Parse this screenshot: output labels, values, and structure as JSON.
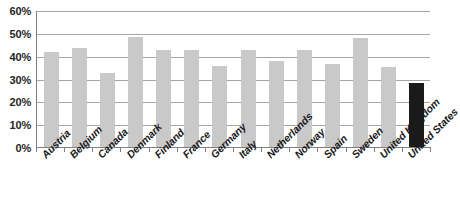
{
  "chart_data": {
    "type": "bar",
    "title": "",
    "subtitle": "",
    "xlabel": "",
    "ylabel": "",
    "ylim": [
      0,
      60
    ],
    "y_unit": "%",
    "grid": true,
    "legend": "none",
    "y_ticks": [
      "0%",
      "10%",
      "20%",
      "30%",
      "40%",
      "50%",
      "60%"
    ],
    "y_tick_values": [
      0,
      10,
      20,
      30,
      40,
      50,
      60
    ],
    "categories": [
      "Austria",
      "Belgium",
      "Canada",
      "Denmark",
      "Finland",
      "France",
      "Germany",
      "Italy",
      "Netherlands",
      "Norway",
      "Spain",
      "Sweden",
      "United Kingdom",
      "United States"
    ],
    "values": [
      42,
      44,
      33,
      48.5,
      43,
      43,
      36,
      43,
      38,
      43,
      37,
      48,
      35.5,
      28.5
    ],
    "bar_colors": [
      "#c9c9c9",
      "#c9c9c9",
      "#c9c9c9",
      "#c9c9c9",
      "#c9c9c9",
      "#c9c9c9",
      "#c9c9c9",
      "#c9c9c9",
      "#c9c9c9",
      "#c9c9c9",
      "#c9c9c9",
      "#c9c9c9",
      "#c9c9c9",
      "#1a1a1a"
    ],
    "highlight_category": "United States",
    "colors": {
      "bar_default": "#c9c9c9",
      "bar_highlight": "#1a1a1a",
      "gridline": "#a6a6a6",
      "axis": "#808080",
      "text": "#1a1a1a",
      "background": "#ffffff"
    }
  }
}
